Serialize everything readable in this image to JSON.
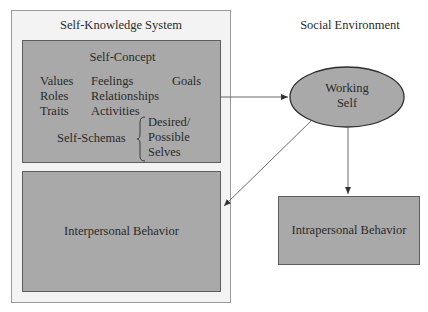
{
  "diagram": {
    "self_knowledge_system": {
      "title": "Self-Knowledge System",
      "self_concept": {
        "title": "Self-Concept",
        "items_col1": [
          "Values",
          "Roles",
          "Traits"
        ],
        "items_col2": [
          "Feelings",
          "Relationships",
          "Activities"
        ],
        "items_col3": [
          "Goals"
        ],
        "self_schemas": {
          "label": "Self-Schemas",
          "items": [
            "Desired/",
            "Possible",
            "Selves"
          ]
        }
      },
      "interpersonal_behavior": "Interpersonal Behavior"
    },
    "social_environment": {
      "title": "Social Environment",
      "working_self": [
        "Working",
        "Self"
      ],
      "intrapersonal_behavior": "Intrapersonal Behavior"
    },
    "colors": {
      "box_fill": "#a9a9a9",
      "outer_fill": "#f3f3f3",
      "line": "#5a5a5a"
    }
  }
}
